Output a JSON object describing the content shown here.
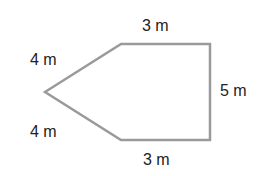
{
  "diagram": {
    "shape": "pentagon",
    "stroke_color": "#9a9a9a",
    "labels": {
      "top": "3 m",
      "right": "5 m",
      "bottom": "3 m",
      "upper_left": "4 m",
      "lower_left": "4 m"
    }
  }
}
